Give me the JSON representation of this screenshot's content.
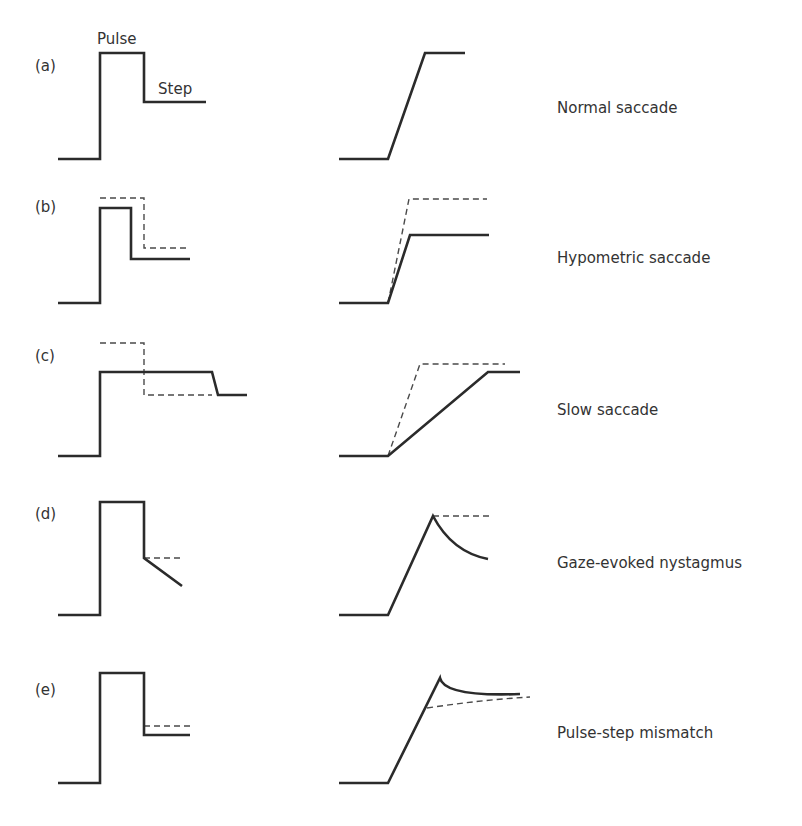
{
  "figure": {
    "annotations": {
      "pulse": "Pulse",
      "step": "Step"
    },
    "panels": [
      {
        "id": "(a)",
        "caption": "Normal saccade"
      },
      {
        "id": "(b)",
        "caption": "Hypometric saccade"
      },
      {
        "id": "(c)",
        "caption": "Slow saccade"
      },
      {
        "id": "(d)",
        "caption": "Gaze-evoked nystagmus"
      },
      {
        "id": "(e)",
        "caption": "Pulse-step mismatch"
      }
    ],
    "legend_styles": {
      "solid": "actual signal / eye position",
      "dashed": "normal reference"
    },
    "colors": {
      "line": "#2b2b2b",
      "dashed": "#4a4a4a",
      "background": "#ffffff"
    }
  }
}
